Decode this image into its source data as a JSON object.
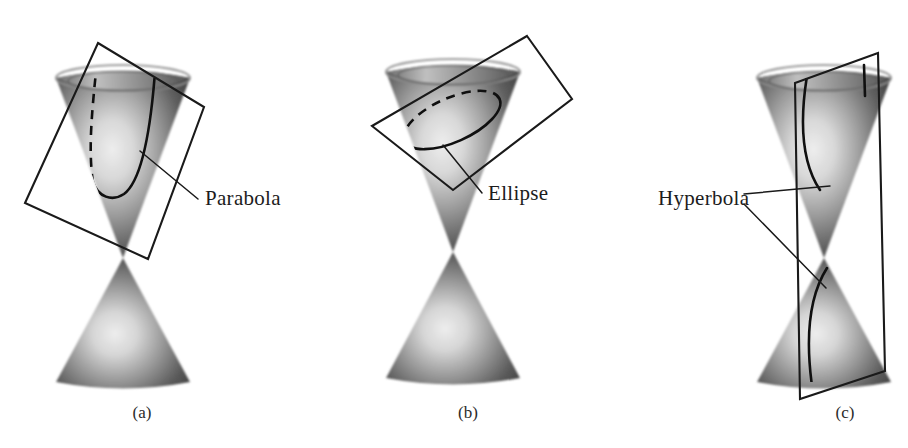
{
  "figure": {
    "background_color": "#ffffff",
    "ink_color": "#1a1a1a",
    "width": 908,
    "height": 448
  },
  "panels": [
    {
      "id": "panel-a",
      "caption": "(a)",
      "caption_x": 142,
      "caption_y": 418,
      "label": "Parabola",
      "label_x": 205,
      "label_y": 205,
      "conic_type": "parabola",
      "plane_description": "tilted rectangular plane cutting one nappe parallel to a slant line",
      "curve_style": "solid front branch with dashed hidden branch"
    },
    {
      "id": "panel-b",
      "caption": "(b)",
      "caption_x": 468,
      "caption_y": 418,
      "label": "Ellipse",
      "label_x": 488,
      "label_y": 200,
      "conic_type": "ellipse",
      "plane_description": "tilted rectangular plane cutting entirely through one nappe",
      "curve_style": "solid front arc with dashed hidden back arc"
    },
    {
      "id": "panel-c",
      "caption": "(c)",
      "caption_x": 845,
      "caption_y": 418,
      "label": "Hyperbola",
      "label_x": 658,
      "label_y": 200,
      "conic_type": "hyperbola",
      "plane_description": "vertical plane cutting both nappes of the double cone",
      "curve_style": "two solid opposing branches"
    }
  ],
  "legend": {
    "cone_shading": {
      "rim_dark": "#4a4a4a",
      "rim_light": "#c9c9c9",
      "body_dark": "#3c3c3c",
      "body_highlight": "#e2e2e2"
    }
  }
}
